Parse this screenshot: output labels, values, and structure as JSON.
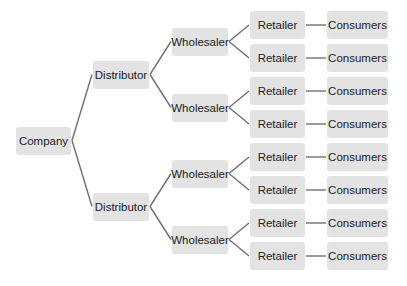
{
  "diagram": {
    "type": "tree",
    "root": {
      "label": "Company",
      "children": [
        {
          "label": "Distributor",
          "children": [
            {
              "label": "Wholesaler",
              "children": [
                {
                  "label": "Retailer",
                  "children": [
                    {
                      "label": "Consumers"
                    }
                  ]
                },
                {
                  "label": "Retailer",
                  "children": [
                    {
                      "label": "Consumers"
                    }
                  ]
                }
              ]
            },
            {
              "label": "Wholesaler",
              "children": [
                {
                  "label": "Retailer",
                  "children": [
                    {
                      "label": "Consumers"
                    }
                  ]
                },
                {
                  "label": "Retailer",
                  "children": [
                    {
                      "label": "Consumers"
                    }
                  ]
                }
              ]
            }
          ]
        },
        {
          "label": "Distributor",
          "children": [
            {
              "label": "Wholesaler",
              "children": [
                {
                  "label": "Retailer",
                  "children": [
                    {
                      "label": "Consumers"
                    }
                  ]
                },
                {
                  "label": "Retailer",
                  "children": [
                    {
                      "label": "Consumers"
                    }
                  ]
                }
              ]
            },
            {
              "label": "Wholesaler",
              "children": [
                {
                  "label": "Retailer",
                  "children": [
                    {
                      "label": "Consumers"
                    }
                  ]
                },
                {
                  "label": "Retailer",
                  "children": [
                    {
                      "label": "Consumers"
                    }
                  ]
                }
              ]
            }
          ]
        }
      ]
    }
  },
  "colors": {
    "node_fill": "#e3e3e3",
    "link": "#707070",
    "text": "#222222"
  }
}
